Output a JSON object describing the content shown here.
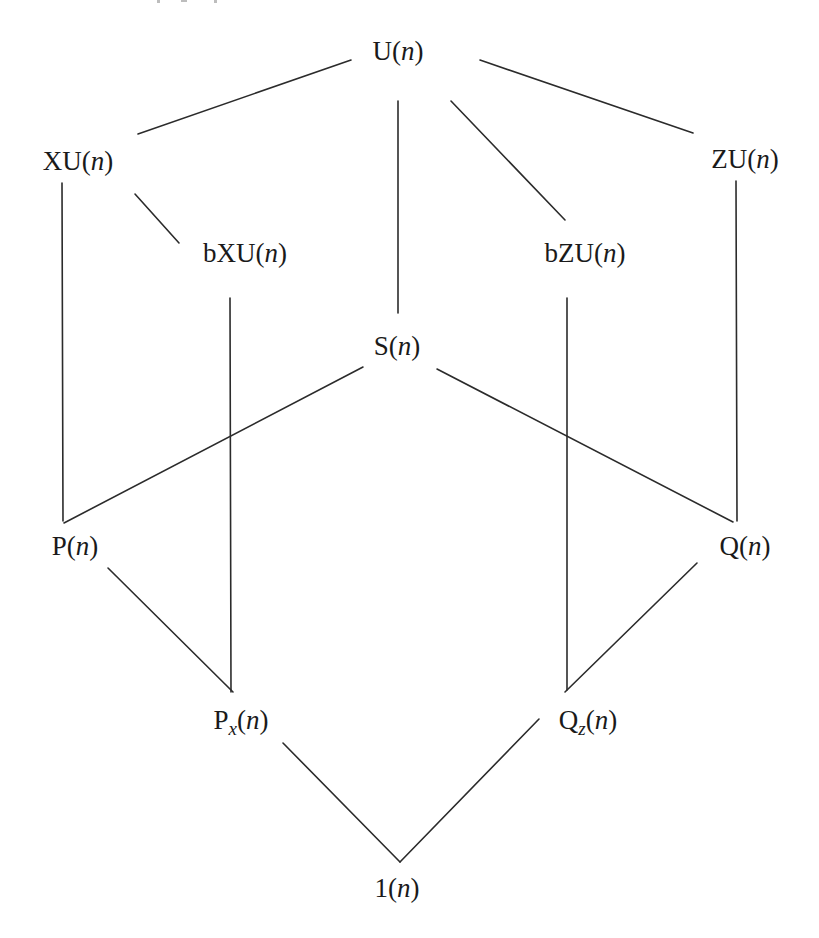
{
  "diagram": {
    "type": "hasse-diagram",
    "colors": {
      "line": "#2b2b2b",
      "text": "#1a1a1a",
      "background": "#ffffff"
    },
    "nodes": [
      {
        "id": "U",
        "base": "U",
        "sub": "",
        "arg": "n",
        "x": 398,
        "y": 60
      },
      {
        "id": "XU",
        "base": "XU",
        "sub": "",
        "arg": "n",
        "x": 78,
        "y": 170
      },
      {
        "id": "ZU",
        "base": "ZU",
        "sub": "",
        "arg": "n",
        "x": 745,
        "y": 168
      },
      {
        "id": "bXU",
        "base": "bXU",
        "sub": "",
        "arg": "n",
        "x": 245,
        "y": 262
      },
      {
        "id": "bZU",
        "base": "bZU",
        "sub": "",
        "arg": "n",
        "x": 585,
        "y": 262
      },
      {
        "id": "S",
        "base": "S",
        "sub": "",
        "arg": "n",
        "x": 397,
        "y": 355
      },
      {
        "id": "P",
        "base": "P",
        "sub": "",
        "arg": "n",
        "x": 75,
        "y": 555
      },
      {
        "id": "Q",
        "base": "Q",
        "sub": "",
        "arg": "n",
        "x": 745,
        "y": 555
      },
      {
        "id": "Px",
        "base": "P",
        "sub": "x",
        "arg": "n",
        "x": 241,
        "y": 729
      },
      {
        "id": "Qz",
        "base": "Q",
        "sub": "z",
        "arg": "n",
        "x": 588,
        "y": 729
      },
      {
        "id": "one",
        "base": "1",
        "sub": "",
        "arg": "n",
        "x": 397,
        "y": 897
      }
    ],
    "edges": [
      {
        "from": "U",
        "to": "XU",
        "x1": 351,
        "y1": 60,
        "x2": 138,
        "y2": 134
      },
      {
        "from": "U",
        "to": "ZU",
        "x1": 480,
        "y1": 60,
        "x2": 693,
        "y2": 133
      },
      {
        "from": "U",
        "to": "S",
        "x1": 398,
        "y1": 101,
        "x2": 398,
        "y2": 313
      },
      {
        "from": "U",
        "to": "bZU",
        "x1": 451,
        "y1": 101,
        "x2": 565,
        "y2": 220
      },
      {
        "from": "XU",
        "to": "bXU",
        "x1": 135,
        "y1": 194,
        "x2": 179,
        "y2": 243
      },
      {
        "from": "XU",
        "to": "P",
        "x1": 62,
        "y1": 183,
        "x2": 63,
        "y2": 521
      },
      {
        "from": "ZU",
        "to": "Q",
        "x1": 736,
        "y1": 181,
        "x2": 737,
        "y2": 521
      },
      {
        "from": "bXU",
        "to": "Px",
        "x1": 230,
        "y1": 298,
        "x2": 231,
        "y2": 692
      },
      {
        "from": "bZU",
        "to": "Qz",
        "x1": 567,
        "y1": 298,
        "x2": 567,
        "y2": 690
      },
      {
        "from": "S",
        "to": "P",
        "x1": 363,
        "y1": 367,
        "x2": 64,
        "y2": 523
      },
      {
        "from": "S",
        "to": "Q",
        "x1": 437,
        "y1": 369,
        "x2": 733,
        "y2": 522
      },
      {
        "from": "P",
        "to": "Px",
        "x1": 108,
        "y1": 568,
        "x2": 233,
        "y2": 692
      },
      {
        "from": "Q",
        "to": "Qz",
        "x1": 697,
        "y1": 563,
        "x2": 565,
        "y2": 692
      },
      {
        "from": "Px",
        "to": "one",
        "x1": 283,
        "y1": 743,
        "x2": 400,
        "y2": 862
      },
      {
        "from": "Qz",
        "to": "one",
        "x1": 539,
        "y1": 719,
        "x2": 400,
        "y2": 862
      }
    ]
  }
}
